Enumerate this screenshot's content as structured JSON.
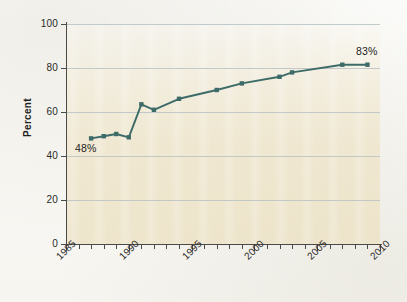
{
  "chart_data": {
    "type": "line",
    "title": "",
    "xlabel": "",
    "ylabel": "Percent",
    "xlim": [
      1985,
      2010
    ],
    "ylim": [
      0,
      100
    ],
    "grid": true,
    "legend": "none",
    "series": [
      {
        "name": "Percent",
        "color": "#3d6b68",
        "marker": "square",
        "x": [
          1987,
          1988,
          1989,
          1990,
          1991,
          1992,
          1994,
          1997,
          1999,
          2002,
          2003,
          2007,
          2009
        ],
        "values": [
          48,
          49,
          50,
          48.5,
          63.5,
          61,
          66,
          70,
          73,
          76,
          78,
          81.5,
          81.5
        ]
      }
    ],
    "x_ticks_major": [
      1985,
      1990,
      1995,
      2000,
      2005,
      2010
    ],
    "x_tick_labels": [
      "1985",
      "1990",
      "1995",
      "2000",
      "2005",
      "2010"
    ],
    "x_ticks_minor": [
      1986,
      1987,
      1988,
      1989,
      1991,
      1992,
      1993,
      1994,
      1996,
      1997,
      1998,
      1999,
      2001,
      2002,
      2003,
      2004,
      2006,
      2007,
      2008,
      2009
    ],
    "y_ticks": [
      0,
      20,
      40,
      60,
      80,
      100
    ],
    "y_tick_labels": [
      "0",
      "20",
      "40",
      "60",
      "80",
      "100"
    ],
    "annotations": [
      {
        "text": "48%",
        "x": 1987,
        "y": 48,
        "position": "below-right"
      },
      {
        "text": "83%",
        "x": 2009,
        "y": 81.5,
        "position": "above-left"
      }
    ]
  },
  "colors": {
    "series_line": "#3d6b68",
    "gridline": "#b9c3c4",
    "axis": "#4a4a48",
    "plot_background": "#efe6c8",
    "text": "#1f1f1e"
  }
}
